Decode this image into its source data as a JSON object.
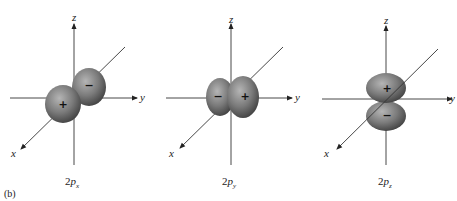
{
  "figure": {
    "panel_label": "(b)",
    "colors": {
      "lobe": "#7a7a7a",
      "lobe_highlight": "#b5b5b5",
      "lobe_shadow": "#3e3e3e",
      "axis": "#333333",
      "background": "#ffffff"
    },
    "orbitals": [
      {
        "name": "2px",
        "caption_main": "2",
        "caption_p": "p",
        "caption_sub": "x",
        "axis_labels": {
          "x": "x",
          "y": "y",
          "z": "z"
        },
        "lobes": [
          {
            "sign": "+",
            "position": "front (along +x)"
          },
          {
            "sign": "−",
            "position": "back (along −x)"
          }
        ]
      },
      {
        "name": "2py",
        "caption_main": "2",
        "caption_p": "p",
        "caption_sub": "y",
        "axis_labels": {
          "x": "x",
          "y": "y",
          "z": "z"
        },
        "lobes": [
          {
            "sign": "−",
            "position": "left (along −y)"
          },
          {
            "sign": "+",
            "position": "right (along +y)"
          }
        ]
      },
      {
        "name": "2pz",
        "caption_main": "2",
        "caption_p": "p",
        "caption_sub": "z",
        "axis_labels": {
          "x": "x",
          "y": "y",
          "z": "z"
        },
        "lobes": [
          {
            "sign": "+",
            "position": "top (along +z)"
          },
          {
            "sign": "−",
            "position": "bottom (along −z)"
          }
        ]
      }
    ]
  }
}
